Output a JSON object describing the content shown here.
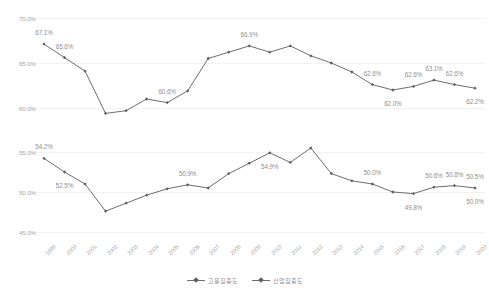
{
  "chart_data": [
    {
      "type": "line",
      "id": "top",
      "title": "",
      "xlabel": "",
      "ylabel": "",
      "ylim": [
        60.0,
        70.0
      ],
      "yticks": [
        "60.0%",
        "65.0%",
        "70.0%"
      ],
      "ytick_values": [
        60.0,
        65.0,
        70.0
      ],
      "grid": true,
      "legend_position": "bottom",
      "series_name": "고용집중도",
      "categories": [
        "1999",
        "2000",
        "2001",
        "2002",
        "2003",
        "2004",
        "2005",
        "2006",
        "2007",
        "2008",
        "2009",
        "2010",
        "2011",
        "2012",
        "2013",
        "2014",
        "2015",
        "2016",
        "2017",
        "2018",
        "2019",
        "2020"
      ],
      "values": [
        67.1,
        65.6,
        64.1,
        59.4,
        59.7,
        61.0,
        60.6,
        61.9,
        65.5,
        66.2,
        66.9,
        66.2,
        66.9,
        65.8,
        65.0,
        64.0,
        62.6,
        62.0,
        62.4,
        63.1,
        62.6,
        62.2
      ],
      "point_labels": [
        {
          "index": 0,
          "text": "67.1%",
          "position": "above"
        },
        {
          "index": 1,
          "text": "65.6%",
          "position": "above"
        },
        {
          "index": 6,
          "text": "60.6%",
          "position": "above"
        },
        {
          "index": 10,
          "text": "66.9%",
          "position": "above"
        },
        {
          "index": 16,
          "text": "62.6%",
          "position": "above"
        },
        {
          "index": 17,
          "text": "62.0%",
          "position": "below"
        },
        {
          "index": 18,
          "text": "62.6%",
          "position": "above"
        },
        {
          "index": 19,
          "text": "63.1%",
          "position": "above"
        },
        {
          "index": 20,
          "text": "62.6%",
          "position": "above"
        },
        {
          "index": 21,
          "text": "62.2%",
          "position": "below"
        }
      ]
    },
    {
      "type": "line",
      "id": "bottom",
      "title": "",
      "xlabel": "",
      "ylabel": "",
      "ylim": [
        45.0,
        55.0
      ],
      "yticks": [
        "45.0%",
        "50.0%",
        "55.0%"
      ],
      "ytick_values": [
        45.0,
        50.0,
        55.0
      ],
      "grid": true,
      "legend_position": "bottom",
      "series_name": "산업집중도",
      "categories": [
        "1999",
        "2000",
        "2001",
        "2002",
        "2003",
        "2004",
        "2005",
        "2006",
        "2007",
        "2008",
        "2009",
        "2010",
        "2011",
        "2012",
        "2013",
        "2014",
        "2015",
        "2016",
        "2017",
        "2018",
        "2019",
        "2020"
      ],
      "values": [
        54.2,
        52.5,
        51.0,
        47.6,
        48.6,
        49.6,
        50.4,
        50.9,
        50.5,
        52.3,
        53.6,
        54.9,
        53.7,
        55.5,
        52.3,
        51.4,
        51.0,
        50.0,
        49.8,
        50.6,
        50.8,
        50.5
      ],
      "point_labels": [
        {
          "index": 0,
          "text": "54.2%",
          "position": "above"
        },
        {
          "index": 1,
          "text": "52.5%",
          "position": "below"
        },
        {
          "index": 7,
          "text": "50.9%",
          "position": "above"
        },
        {
          "index": 11,
          "text": "54.9%",
          "position": "below"
        },
        {
          "index": 16,
          "text": "50.0%",
          "position": "above"
        },
        {
          "index": 18,
          "text": "49.8%",
          "position": "below"
        },
        {
          "index": 19,
          "text": "50.6%",
          "position": "above"
        },
        {
          "index": 20,
          "text": "50.8%",
          "position": "above"
        },
        {
          "index": 21,
          "text": "50.5%",
          "position": "above"
        },
        {
          "index": 21,
          "text": "50.0%",
          "position": "below"
        }
      ]
    }
  ],
  "axis": {
    "categories": [
      "1999",
      "2000",
      "2001",
      "2002",
      "2003",
      "2004",
      "2005",
      "2006",
      "2007",
      "2008",
      "2009",
      "2010",
      "2011",
      "2012",
      "2013",
      "2014",
      "2015",
      "2016",
      "2017",
      "2018",
      "2019",
      "2020"
    ]
  },
  "legend": {
    "items": [
      {
        "label": "고용집중도",
        "color": "#6e6e6e",
        "marker": "diamond"
      },
      {
        "label": "산업집중도",
        "color": "#6e6e6e",
        "marker": "diamond"
      }
    ]
  },
  "colors": {
    "line": "#6e6e6e",
    "marker": "#5f5f5f",
    "grid": "#f2f2f2",
    "text": "#8f8f8f",
    "axis_text": "#a8a8a8",
    "background": "#ffffff"
  }
}
